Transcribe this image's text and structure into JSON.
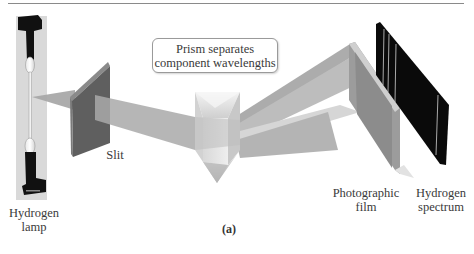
{
  "figure": {
    "caption": "(a)",
    "callout": {
      "line1": "Prism separates",
      "line2": "component wavelengths"
    },
    "labels": {
      "lamp": {
        "line1": "Hydrogen",
        "line2": "lamp"
      },
      "slit": {
        "line1": "Slit"
      },
      "film": {
        "line1": "Photographic",
        "line2": "film"
      },
      "spectrum": {
        "line1": "Hydrogen",
        "line2": "spectrum"
      }
    },
    "components": [
      "hydrogen-lamp",
      "slit",
      "prism",
      "photographic-film",
      "hydrogen-spectrum"
    ],
    "colors": {
      "beam": "#a9a9a9",
      "slit_face": "#5f5f5f",
      "slit_edge": "#8a8a8a",
      "prism_light": "#e6e6e6",
      "prism_mid": "#c4c4c4",
      "film": "#9a9a9a",
      "spectrum_bg": "#0a0a0a",
      "spectrum_line": "#d0d0d0",
      "rule": "#8a8a8a"
    },
    "spectrum_lines_count": 4
  }
}
